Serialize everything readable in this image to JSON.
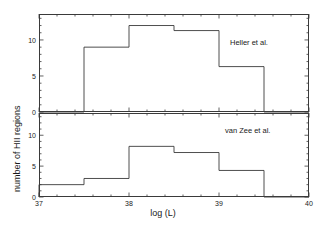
{
  "figure": {
    "background": "#ffffff",
    "line_color": "#3a3a3a",
    "text_color": "#1a1a1a"
  },
  "axis_titles": {
    "x": "log (L)",
    "y": "number of HII regions"
  },
  "xaxis": {
    "min": 37,
    "max": 40,
    "ticks": [
      37,
      38,
      39,
      40
    ],
    "tick_labels": [
      "37",
      "38",
      "39",
      "40"
    ],
    "minor_step": 0.2
  },
  "panels": [
    {
      "id": "top-panel",
      "label": "Heller et al.",
      "ymin": 0,
      "ymax": 13.6,
      "yticks": [
        0,
        5,
        10
      ],
      "ytick_labels": [
        "0",
        "5",
        "10"
      ],
      "bin_edges": [
        37.0,
        37.5,
        38.0,
        38.5,
        39.0,
        39.5,
        40.0
      ],
      "values": [
        0,
        9,
        12,
        11.3,
        6.3,
        0
      ]
    },
    {
      "id": "bottom-panel",
      "label": "van Zee et al.",
      "ymin": 0,
      "ymax": 13.6,
      "yticks": [
        0,
        5,
        10
      ],
      "ytick_labels": [
        "0",
        "5",
        "10"
      ],
      "bin_edges": [
        37.0,
        37.5,
        38.0,
        38.5,
        39.0,
        39.5,
        40.0
      ],
      "values": [
        2,
        3,
        8.2,
        7.2,
        4.3,
        0
      ]
    }
  ],
  "chart_data": {
    "type": "bar",
    "title": "",
    "subtitle": "",
    "xlabel": "log (L)",
    "ylabel": "number of HII regions",
    "xlim": [
      37,
      40
    ],
    "ylim": [
      0,
      13.6
    ],
    "grid": false,
    "legend_position": "inside-top-right",
    "bin_width": 0.5,
    "bin_edges": [
      37.0,
      37.5,
      38.0,
      38.5,
      39.0,
      39.5,
      40.0
    ],
    "categories": [
      "37.0-37.5",
      "37.5-38.0",
      "38.0-38.5",
      "38.5-39.0",
      "39.0-39.5",
      "39.5-40.0"
    ],
    "xticks": [
      37,
      38,
      39,
      40
    ],
    "xtick_labels": [
      "37",
      "38",
      "39",
      "40"
    ],
    "yticks": [
      0,
      5,
      10
    ],
    "ytick_labels": [
      "0",
      "5",
      "10"
    ],
    "series": [
      {
        "name": "Heller et al.",
        "panel": "top",
        "values": [
          0,
          9,
          12,
          11.3,
          6.3,
          0
        ]
      },
      {
        "name": "van Zee et al.",
        "panel": "bottom",
        "values": [
          2,
          3,
          8.2,
          7.2,
          4.3,
          0
        ]
      }
    ],
    "annotations": [
      {
        "text": "Heller et al.",
        "panel": "top",
        "x": 39.3,
        "y": 11.8
      },
      {
        "text": "van Zee et al.",
        "panel": "bottom",
        "x": 39.25,
        "y": 10.6
      }
    ]
  }
}
